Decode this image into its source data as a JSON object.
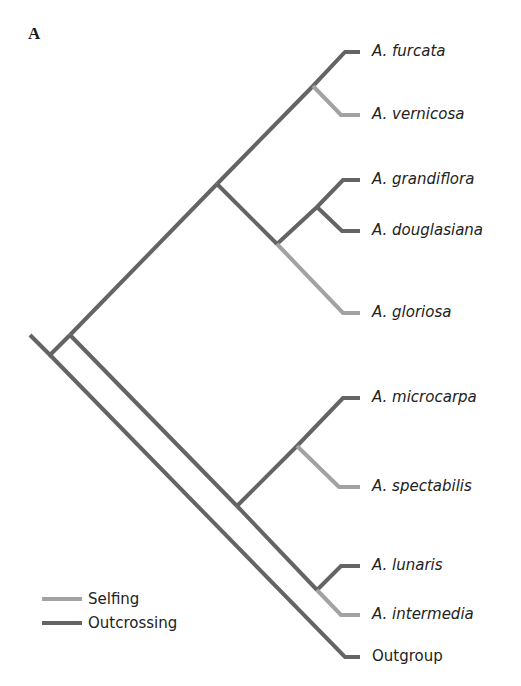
{
  "figure": {
    "panel_label": "A",
    "colors": {
      "outcrossing": "#646464",
      "selfing": "#a2a2a2"
    }
  },
  "taxa": [
    {
      "name": "A. furcata",
      "mating": "Outcrossing",
      "italic": true
    },
    {
      "name": "A. vernicosa",
      "mating": "Selfing",
      "italic": true
    },
    {
      "name": "A. grandiflora",
      "mating": "Outcrossing",
      "italic": true
    },
    {
      "name": "A. douglasiana",
      "mating": "Outcrossing",
      "italic": true
    },
    {
      "name": "A. gloriosa",
      "mating": "Selfing",
      "italic": true
    },
    {
      "name": "A. microcarpa",
      "mating": "Outcrossing",
      "italic": true
    },
    {
      "name": "A. spectabilis",
      "mating": "Selfing",
      "italic": true
    },
    {
      "name": "A. lunaris",
      "mating": "Outcrossing",
      "italic": true
    },
    {
      "name": "A. intermedia",
      "mating": "Selfing",
      "italic": true
    },
    {
      "name": "Outgroup",
      "mating": "Outcrossing",
      "italic": false
    }
  ],
  "legend": {
    "items": [
      {
        "label": "Selfing",
        "color": "#a2a2a2"
      },
      {
        "label": "Outcrossing",
        "color": "#646464"
      }
    ]
  }
}
